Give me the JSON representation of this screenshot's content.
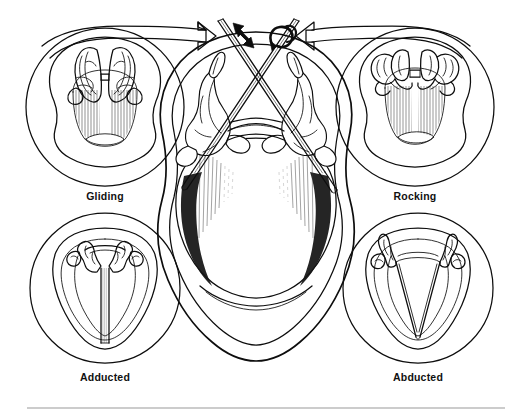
{
  "figure": {
    "background_color": "#ffffff",
    "ink_color": "#0d0d0d",
    "width": 513,
    "height": 416
  },
  "panels": [
    {
      "id": "gliding",
      "label": "Gliding",
      "position": "top-left",
      "center": {
        "x": 105,
        "y": 107
      },
      "radius": 79,
      "label_x": 105,
      "label_y": 200,
      "description": "Superior laryngoscopic view with arytenoid cartilages shown gliding along the cricoid facets"
    },
    {
      "id": "rocking",
      "label": "Rocking",
      "position": "top-right",
      "center": {
        "x": 415,
        "y": 107
      },
      "radius": 79,
      "label_x": 415,
      "label_y": 200,
      "description": "Superior laryngoscopic view with arytenoid cartilages shown rocking about the cricoarytenoid joint"
    },
    {
      "id": "adducted",
      "label": "Adducted",
      "position": "bottom-left",
      "center": {
        "x": 105,
        "y": 288
      },
      "radius": 75,
      "label_x": 105,
      "label_y": 381,
      "description": "Vocal folds in the adducted (closed) position"
    },
    {
      "id": "abducted",
      "label": "Abducted",
      "position": "bottom-right",
      "center": {
        "x": 418,
        "y": 288
      },
      "radius": 75,
      "label_x": 418,
      "label_y": 381,
      "description": "Vocal folds in the abducted (open) position"
    }
  ],
  "center_illustration": {
    "id": "central-larynx",
    "description": "Large superior view of the larynx with two crossing rods representing the axes of arytenoid motion",
    "center": {
      "x": 256,
      "y": 200
    }
  },
  "motion_indicators": [
    {
      "id": "gliding-arrow",
      "type": "double-headed-straight-arrow",
      "meaning": "Gliding translation along the rod axis",
      "attached_to": "left-rod"
    },
    {
      "id": "rocking-arrow",
      "type": "curved-rotation-arrow",
      "meaning": "Rocking rotation about the rod axis",
      "attached_to": "right-rod"
    }
  ],
  "connector_arrows": [
    {
      "id": "gliding-connector",
      "from_panel": "gliding",
      "to": "left-rod-tip",
      "direction": "right",
      "style": "outlined-open-arrowhead"
    },
    {
      "id": "rocking-connector",
      "from_panel": "rocking",
      "to": "right-rod-tip",
      "direction": "left",
      "style": "outlined-open-arrowhead"
    }
  ],
  "footer_rule": {
    "id": "bottom-divider",
    "x1": 27,
    "x2": 505,
    "y": 408,
    "color": "#9a9a9a"
  }
}
